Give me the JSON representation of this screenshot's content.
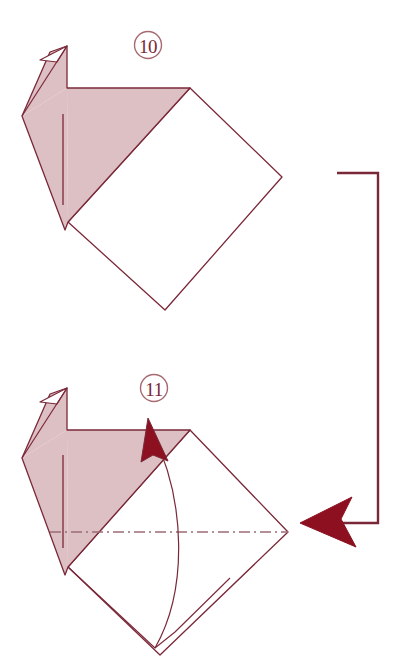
{
  "document": {
    "type": "origami-instruction-diagram",
    "title": "Origami folding steps 10 and 11",
    "background_color": "#ffffff",
    "width": 399,
    "height": 668
  },
  "palette": {
    "paper_front_fill": "#ddc0c4",
    "paper_back_fill": "#ffffff",
    "stroke": "#7a2838",
    "arrow_fill": "#8c1020",
    "arrow_stroke": "#7a2838",
    "fold_line": "#9c6b74"
  },
  "steps": [
    {
      "id": "step-10",
      "number": "10",
      "label_position": {
        "x": 148,
        "y": 45
      },
      "shape_description": "Bird base with shaded head and neck over a white rotated square",
      "shaded_fill": "#ddc0c4",
      "white_fill": "#ffffff",
      "crease_line": {
        "x": 63,
        "y1": 114,
        "y2": 205
      },
      "beak": "white triangular notch at upper left",
      "diamond_vertices": "190,88 282,177 165,310 68,222"
    },
    {
      "id": "step-11",
      "number": "11",
      "label_position": {
        "x": 154,
        "y": 388
      },
      "shape_description": "Same base with mountain fold chain line and curved valley fold arrow",
      "shaded_fill": "#ddc0c4",
      "white_fill": "#ffffff",
      "crease_line": {
        "x": 63,
        "y1": 455,
        "y2": 548
      },
      "fold_line_style": "dash-dot",
      "fold_line": {
        "x1": 50,
        "x2": 288,
        "y": 532
      },
      "fold_arrow": "curved valley fold arrow pointing up-left",
      "diamond_vertices": "190,430 288,532 160,655 68,567"
    }
  ],
  "repeat_arrow": {
    "name": "repeat-step-arrow",
    "description": "Bracket arrow indicating the result of step 10 continues to step 11",
    "path": "337,173 378,173 378,523 300,523",
    "head_direction": "left",
    "head_tip": {
      "x": 300,
      "y": 523
    },
    "color": "#8c1020"
  },
  "fold_arrow_step11": {
    "name": "valley-fold-arrow",
    "arc_from": {
      "x": 155,
      "y": 648
    },
    "arc_to": {
      "x": 152,
      "y": 428
    },
    "head_direction": "up-left",
    "color": "#8c1020"
  }
}
